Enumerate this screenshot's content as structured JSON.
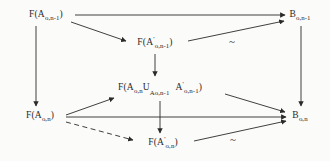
{
  "figure": {
    "type": "commutative-diagram",
    "background_color": "#fbfbfa",
    "stroke_color": "#2a2a2a"
  },
  "nodes": {
    "top_left": {
      "name": "F(A_o,n-1)",
      "func": "F(A",
      "sub": "o,n-1",
      "close": ")",
      "x": 46,
      "y": 16
    },
    "top_right": {
      "name": "B_o,n-1",
      "base": "B",
      "sub": "o,n-1",
      "x": 300,
      "y": 16
    },
    "upper_mid": {
      "name": "F(A'_o,n-1)",
      "func": "F(A",
      "prime": "'",
      "sub": "o,n-1",
      "close": ")",
      "x": 155,
      "y": 43
    },
    "center_union": {
      "name": "F(A_o,n U_A_o,n-1 A'_o,n-1)",
      "func": "F(A",
      "sub1": "o,n",
      "op": "U",
      "opsub": "A",
      "opsub2": "o,n-1",
      "second": "A",
      "prime": "'",
      "sub2": "o,n-1",
      "close": ")",
      "x": 160,
      "y": 89
    },
    "bottom_left": {
      "name": "F(A_o,n)",
      "func": "F(A",
      "sub": "o,n",
      "close": ")",
      "x": 40,
      "y": 117
    },
    "bottom_right": {
      "name": "B_o,n",
      "base": "B",
      "sub": "o,n",
      "x": 300,
      "y": 117
    },
    "lower_mid": {
      "name": "F(A'_o,n)",
      "func": "F(A",
      "prime": "'",
      "sub": "o,n",
      "close": ")",
      "x": 163,
      "y": 143
    }
  },
  "equivalence_markers": [
    {
      "symbol": "~",
      "x": 232,
      "y": 41,
      "label": "upper-tilde"
    },
    {
      "symbol": "~",
      "x": 233,
      "y": 139,
      "label": "lower-tilde"
    }
  ],
  "arrows": [
    {
      "id": "top-horizontal",
      "from": "top_left",
      "to": "top_right",
      "style": "solid"
    },
    {
      "id": "top-left-to-upper-mid",
      "from": "top_left",
      "to": "upper_mid",
      "style": "solid"
    },
    {
      "id": "upper-mid-to-top-right",
      "from": "upper_mid",
      "to": "top_right",
      "style": "solid"
    },
    {
      "id": "left-vertical",
      "from": "top_left",
      "to": "bottom_left",
      "style": "solid"
    },
    {
      "id": "right-vertical",
      "from": "top_right",
      "to": "bottom_right",
      "style": "solid"
    },
    {
      "id": "upper-mid-to-center",
      "from": "upper_mid",
      "to": "center_union",
      "style": "solid"
    },
    {
      "id": "center-to-lower-mid",
      "from": "center_union",
      "to": "lower_mid",
      "style": "solid"
    },
    {
      "id": "bottom-left-to-center",
      "from": "bottom_left",
      "to": "center_union",
      "style": "solid"
    },
    {
      "id": "center-to-bottom-right",
      "from": "center_union",
      "to": "bottom_right",
      "style": "solid"
    },
    {
      "id": "bottom-horizontal",
      "from": "bottom_left",
      "to": "bottom_right",
      "style": "solid"
    },
    {
      "id": "bottom-left-to-lower-mid-dashed",
      "from": "bottom_left",
      "to": "lower_mid",
      "style": "dashed"
    },
    {
      "id": "lower-mid-to-bottom-right",
      "from": "lower_mid",
      "to": "bottom_right",
      "style": "solid"
    }
  ]
}
